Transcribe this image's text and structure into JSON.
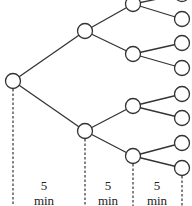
{
  "diagram": {
    "type": "binary-tree-timeline",
    "stroke_color": "#333333",
    "nodes": [
      {
        "id": "root",
        "x": 13,
        "y": 81,
        "level": 0
      },
      {
        "id": "a",
        "x": 85,
        "y": 31,
        "level": 1
      },
      {
        "id": "b",
        "x": 85,
        "y": 131,
        "level": 1
      },
      {
        "id": "aa",
        "x": 133,
        "y": 4,
        "level": 2
      },
      {
        "id": "ab",
        "x": 133,
        "y": 54,
        "level": 2
      },
      {
        "id": "ba",
        "x": 133,
        "y": 106,
        "level": 2
      },
      {
        "id": "bb",
        "x": 133,
        "y": 156,
        "level": 2
      },
      {
        "id": "aaa",
        "x": 182,
        "y": -6,
        "level": 3
      },
      {
        "id": "aab",
        "x": 182,
        "y": 19,
        "level": 3
      },
      {
        "id": "aba",
        "x": 182,
        "y": 43,
        "level": 3
      },
      {
        "id": "abb",
        "x": 182,
        "y": 68,
        "level": 3
      },
      {
        "id": "baa",
        "x": 182,
        "y": 94,
        "level": 3
      },
      {
        "id": "bab",
        "x": 182,
        "y": 118,
        "level": 3
      },
      {
        "id": "bba",
        "x": 182,
        "y": 143,
        "level": 3
      },
      {
        "id": "bbb",
        "x": 182,
        "y": 168,
        "level": 3
      }
    ],
    "edges": [
      [
        "root",
        "a"
      ],
      [
        "root",
        "b"
      ],
      [
        "a",
        "aa"
      ],
      [
        "a",
        "ab"
      ],
      [
        "b",
        "ba"
      ],
      [
        "b",
        "bb"
      ],
      [
        "aa",
        "aaa"
      ],
      [
        "aa",
        "aab"
      ],
      [
        "ab",
        "aba"
      ],
      [
        "ab",
        "abb"
      ],
      [
        "ba",
        "baa"
      ],
      [
        "ba",
        "bab"
      ],
      [
        "bb",
        "bba"
      ],
      [
        "bb",
        "bbb"
      ]
    ],
    "time_markers": [
      {
        "x": 13,
        "from_y": 89
      },
      {
        "x": 85,
        "from_y": 139
      },
      {
        "x": 133,
        "from_y": 164
      },
      {
        "x": 182,
        "from_y": 176
      }
    ],
    "intervals": [
      {
        "value": "5",
        "unit": "min",
        "center_x": 44
      },
      {
        "value": "5",
        "unit": "min",
        "center_x": 108
      },
      {
        "value": "5",
        "unit": "min",
        "center_x": 157
      }
    ]
  }
}
